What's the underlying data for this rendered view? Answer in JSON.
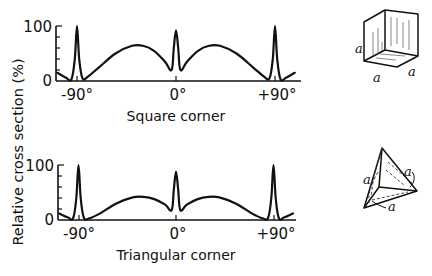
{
  "figure": {
    "y_axis_label": "Relative cross section (%)",
    "panels": [
      {
        "caption": "Square corner",
        "y_ticks": {
          "top": "100",
          "bottom": "0"
        },
        "x_ticks": [
          "-90°",
          "0°",
          "+90°"
        ],
        "inset_label": "a"
      },
      {
        "caption": "Triangular corner",
        "y_ticks": {
          "top": "100",
          "bottom": "0"
        },
        "x_ticks": [
          "-90°",
          "0°",
          "+90°"
        ],
        "inset_label": "a"
      }
    ]
  },
  "chart_data": [
    {
      "type": "line",
      "title": "Square corner",
      "xlabel": "Angle (degrees)",
      "ylabel": "Relative cross section (%)",
      "xlim": [
        -108,
        108
      ],
      "ylim": [
        0,
        100
      ],
      "x_tick_labels": [
        "-90°",
        "0°",
        "+90°"
      ],
      "y_tick_labels": [
        "0",
        "100"
      ],
      "grid": false,
      "inset": "cube with edge length a",
      "x": [
        -108,
        -100,
        -95,
        -92,
        -90,
        -88,
        -85,
        -80,
        -70,
        -55,
        -40,
        -30,
        -20,
        -10,
        -4,
        -2,
        0,
        2,
        4,
        10,
        20,
        30,
        40,
        55,
        70,
        80,
        85,
        88,
        90,
        92,
        95,
        100,
        108
      ],
      "y": [
        15,
        6,
        3,
        40,
        100,
        40,
        5,
        8,
        25,
        50,
        64,
        64,
        55,
        35,
        20,
        60,
        92,
        60,
        20,
        35,
        55,
        64,
        64,
        50,
        25,
        8,
        5,
        40,
        100,
        40,
        3,
        6,
        15
      ]
    },
    {
      "type": "line",
      "title": "Triangular corner",
      "xlabel": "Angle (degrees)",
      "ylabel": "Relative cross section (%)",
      "xlim": [
        -108,
        108
      ],
      "ylim": [
        0,
        100
      ],
      "x_tick_labels": [
        "-90°",
        "0°",
        "+90°"
      ],
      "y_tick_labels": [
        "0",
        "100"
      ],
      "grid": false,
      "inset": "trihedral corner reflector with edge length a",
      "x": [
        -108,
        -100,
        -95,
        -92,
        -90,
        -88,
        -85,
        -80,
        -70,
        -55,
        -40,
        -30,
        -20,
        -10,
        -4,
        -2,
        0,
        2,
        4,
        10,
        20,
        30,
        40,
        55,
        70,
        80,
        85,
        88,
        90,
        92,
        95,
        100,
        108
      ],
      "y": [
        12,
        5,
        3,
        40,
        100,
        40,
        4,
        3,
        12,
        30,
        41,
        42,
        38,
        28,
        18,
        55,
        88,
        55,
        18,
        28,
        38,
        42,
        41,
        30,
        12,
        3,
        4,
        40,
        100,
        40,
        3,
        5,
        12
      ]
    }
  ]
}
